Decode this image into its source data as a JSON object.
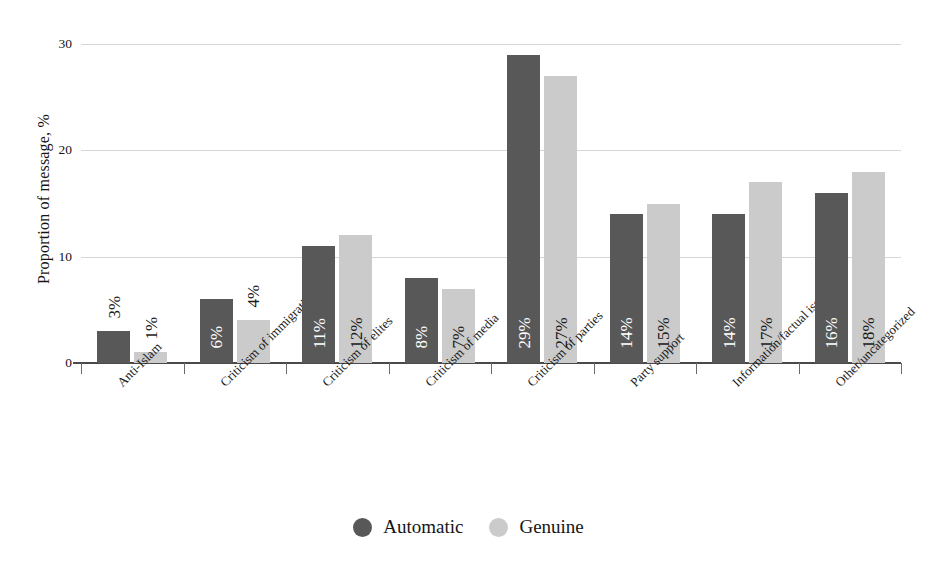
{
  "chart_data": {
    "type": "bar",
    "title": "",
    "xlabel": "",
    "ylabel": "Proportion of message, %",
    "ylim": [
      0,
      30
    ],
    "yticks": [
      0,
      10,
      20,
      30
    ],
    "ytick_labels": [
      "0",
      "10",
      "20",
      "30"
    ],
    "grid": true,
    "legend_position": "bottom-center",
    "categories": [
      "Anti-Islam",
      "Criticism of immigration",
      "Criticism of elites",
      "Criticism of media",
      "Criticism of parties",
      "Party support",
      "Information/factual issues",
      "Other/uncategorized"
    ],
    "series": [
      {
        "name": "Automatic",
        "color": "#585858",
        "values": [
          3,
          6,
          11,
          8,
          29,
          14,
          14,
          16
        ],
        "labels": [
          "3%",
          "6%",
          "11%",
          "8%",
          "29%",
          "14%",
          "14%",
          "16%"
        ]
      },
      {
        "name": "Genuine",
        "color": "#cbcbcb",
        "values": [
          1,
          4,
          12,
          7,
          27,
          15,
          17,
          18
        ],
        "labels": [
          "1%",
          "4%",
          "12%",
          "7%",
          "27%",
          "15%",
          "17%",
          "18%"
        ]
      }
    ]
  },
  "legend": {
    "items": [
      {
        "label": "Automatic",
        "color": "#585858"
      },
      {
        "label": "Genuine",
        "color": "#cbcbcb"
      }
    ]
  },
  "axis": {
    "y_title": "Proportion of message, %"
  },
  "colors": {
    "automatic": "#585858",
    "genuine": "#cbcbcb",
    "gridline": "#d6d6d6",
    "axis": "#4a4a4a",
    "background": "#ffffff"
  }
}
